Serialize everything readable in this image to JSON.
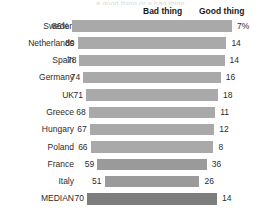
{
  "title_remnant": "a good thing or a bad thing",
  "headers": {
    "bad": "Bad thing",
    "good": "Good thing"
  },
  "chart_data": {
    "type": "bar",
    "title": "",
    "subtitle": "",
    "xlabel": "",
    "ylabel": "",
    "orientation": "horizontal",
    "layout": "centered-diverging",
    "grid": false,
    "legend_position": "top",
    "series": [
      {
        "name": "Bad thing",
        "values": [
          86,
          80,
          78,
          74,
          71,
          68,
          67,
          66,
          59,
          51,
          70
        ]
      },
      {
        "name": "Good thing",
        "values": [
          7,
          14,
          14,
          16,
          18,
          11,
          12,
          8,
          36,
          26,
          14
        ]
      }
    ],
    "categories": [
      "Sweden",
      "Netherlands",
      "Spain",
      "Germany",
      "UK",
      "Greece",
      "Hungary",
      "Poland",
      "France",
      "Italy",
      "MEDIAN"
    ],
    "rows": [
      {
        "label": "Sweden",
        "bad": 86,
        "good": 7,
        "bad_text": "86%",
        "good_text": "7%",
        "median": false,
        "emphasis": false
      },
      {
        "label": "Netherlands",
        "bad": 80,
        "good": 14,
        "bad_text": "80",
        "good_text": "14",
        "median": false,
        "emphasis": false
      },
      {
        "label": "Spain",
        "bad": 78,
        "good": 14,
        "bad_text": "78",
        "good_text": "14",
        "median": false,
        "emphasis": false
      },
      {
        "label": "Germany",
        "bad": 74,
        "good": 16,
        "bad_text": "74",
        "good_text": "16",
        "median": false,
        "emphasis": false
      },
      {
        "label": "UK",
        "bad": 71,
        "good": 18,
        "bad_text": "71",
        "good_text": "18",
        "median": false,
        "emphasis": false
      },
      {
        "label": "Greece",
        "bad": 68,
        "good": 11,
        "bad_text": "68",
        "good_text": "11",
        "median": false,
        "emphasis": false
      },
      {
        "label": "Hungary",
        "bad": 67,
        "good": 12,
        "bad_text": "67",
        "good_text": "12",
        "median": false,
        "emphasis": false
      },
      {
        "label": "Poland",
        "bad": 66,
        "good": 8,
        "bad_text": "66",
        "good_text": "8",
        "median": false,
        "emphasis": false
      },
      {
        "label": "France",
        "bad": 59,
        "good": 36,
        "bad_text": "59",
        "good_text": "36",
        "median": false,
        "emphasis": true
      },
      {
        "label": "Italy",
        "bad": 51,
        "good": 26,
        "bad_text": "51",
        "good_text": "26",
        "median": false,
        "emphasis": true
      },
      {
        "label": "MEDIAN",
        "bad": 70,
        "good": 14,
        "bad_text": "70",
        "good_text": "14",
        "median": true,
        "emphasis": false
      }
    ]
  },
  "colors": {
    "bar": "#a9a9a9",
    "bar_emphasis": "#9a9a9a",
    "bar_median": "#7d7d7d",
    "text": "#2c2c2c",
    "background": "#ffffff"
  }
}
